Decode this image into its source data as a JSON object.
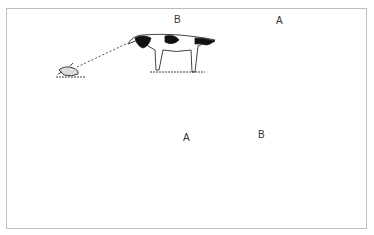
{
  "figure": {
    "top_panel": {
      "label_left_dog": "B",
      "label_right_dog": "A",
      "description": "Dog B points at a bird on the ground (dashed line of sight); dog A stands behind."
    },
    "bottom_panel": {
      "label_left_dog": "A",
      "label_right_dog": "B",
      "description": "Bird flushes; dog A lunges forward (marked with star burst), dog B stands; arrows show movement."
    },
    "colors": {
      "ink": "#111111",
      "border": "#bdbdbd",
      "background": "#ffffff"
    }
  }
}
